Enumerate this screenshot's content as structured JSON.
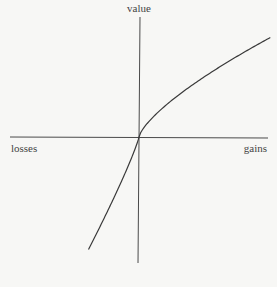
{
  "chart_data": {
    "type": "line",
    "title": "",
    "subtitle": "",
    "xlabel_negative": "losses",
    "xlabel_positive": "gains",
    "ylabel": "value",
    "xlim": [
      -1,
      2.6
    ],
    "ylim": [
      -2.7,
      2.4
    ],
    "grid": false,
    "legend": "none",
    "series": [
      {
        "name": "value-function",
        "gains_exponent": 0.72,
        "loss_aversion": 2.25,
        "losses_exponent": 0.88,
        "x_range": [
          -1,
          2.6
        ]
      }
    ]
  },
  "labels": {
    "y_axis": "value",
    "x_axis_left": "losses",
    "x_axis_right": "gains"
  },
  "colors": {
    "background": "#f7f7f5",
    "axes": "#4a4a4a",
    "curve": "#3a3a3a",
    "text": "#444444"
  }
}
